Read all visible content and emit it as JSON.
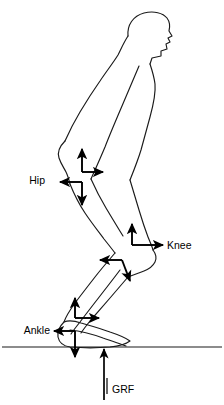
{
  "figure": {
    "facing": "right",
    "stroke_color": "#1a1a1a",
    "arrow_color": "#000000",
    "background_color": "#ffffff"
  },
  "labels": {
    "hip": "Hip",
    "knee": "Knee",
    "ankle": "Ankle",
    "grf": "GRF"
  },
  "joints": [
    {
      "id": "hip",
      "label": "Hip",
      "label_side": "left",
      "label_x": 45,
      "label_y": 180,
      "proximal_origin_x": 82,
      "proximal_origin_y": 172,
      "distal_origin_x": 82,
      "distal_origin_y": 182,
      "proximal_arrows": [
        "up",
        "right"
      ],
      "distal_arrows": [
        "left",
        "down"
      ]
    },
    {
      "id": "knee",
      "label": "Knee",
      "label_side": "right",
      "label_x": 170,
      "label_y": 246,
      "proximal_origin_x": 132,
      "proximal_origin_y": 245,
      "distal_origin_x": 122,
      "distal_origin_y": 260,
      "proximal_arrows": [
        "up",
        "right"
      ],
      "distal_arrows": [
        "left",
        "down"
      ]
    },
    {
      "id": "ankle",
      "label": "Ankle",
      "label_side": "left",
      "label_x": 48,
      "label_y": 331,
      "proximal_origin_x": 75,
      "proximal_origin_y": 318,
      "distal_origin_x": 75,
      "distal_origin_y": 331,
      "proximal_arrows": [
        "up",
        "right"
      ],
      "distal_arrows": [
        "left",
        "down"
      ]
    }
  ],
  "ground_reaction_force": {
    "label": "GRF",
    "label_x": 113,
    "label_y": 390,
    "direction": "up",
    "tail_x": 104,
    "tail_y": 400,
    "head_x": 104,
    "head_y": 349
  },
  "ground": {
    "y": 347,
    "x_start": 2,
    "x_end": 222
  }
}
